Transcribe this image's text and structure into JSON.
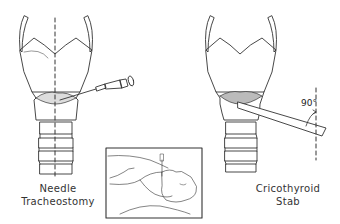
{
  "figure": {
    "left_panel": {
      "label_line1": "Needle",
      "label_line2": "Tracheostomy"
    },
    "right_panel": {
      "label_line1": "Cricothyroid",
      "label_line2": "Stab",
      "angle_annotation": "90°"
    },
    "inset": {
      "description": "patient supine with neck extended, needle inserted at throat"
    }
  }
}
